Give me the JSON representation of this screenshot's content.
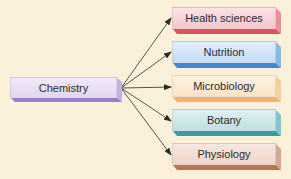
{
  "diagram": {
    "type": "hub-and-spoke",
    "source": {
      "label": "Chemistry",
      "colors": {
        "front": "#e3d6f0",
        "front_light": "#f1eaf8",
        "bottom": "#9b7fc4",
        "side": "#c4b0e0"
      }
    },
    "targets": [
      {
        "label": "Health sciences",
        "colors": {
          "front": "#f7c7cd",
          "front_light": "#fce2e4",
          "bottom": "#e0505f",
          "side": "#ee8e98"
        }
      },
      {
        "label": "Nutrition",
        "colors": {
          "front": "#c6dcf4",
          "front_light": "#e2eefa",
          "bottom": "#3f88d4",
          "side": "#8ab8e6"
        }
      },
      {
        "label": "Microbiology",
        "colors": {
          "front": "#fbe4c8",
          "front_light": "#fdf1e2",
          "bottom": "#f0b46a",
          "side": "#f6cf9c"
        }
      },
      {
        "label": "Botany",
        "colors": {
          "front": "#bfe0e2",
          "front_light": "#dff0f1",
          "bottom": "#3a9aa2",
          "side": "#86c4c8"
        }
      },
      {
        "label": "Physiology",
        "colors": {
          "front": "#eed4c8",
          "front_light": "#f7e8e1",
          "bottom": "#b57556",
          "side": "#d4a892"
        }
      }
    ],
    "arrow_color": "#2b2b2b",
    "background": "#fbf1da"
  }
}
